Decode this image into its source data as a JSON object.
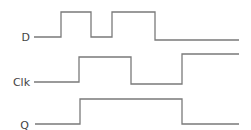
{
  "diagram": {
    "type": "timing-diagram",
    "stroke_color": "#7a7a7a",
    "label_color": "#444444",
    "signals": [
      {
        "name": "D",
        "label_x": 30,
        "label_y": 41,
        "points": "34,37 61,37 61,12 91,12 91,37 112,37 112,12 155,12 155,40 239,40"
      },
      {
        "name": "Clk",
        "label_x": 30,
        "label_y": 86,
        "points": "34,82 79,82 79,57 131,57 131,84 182,84 182,54 239,54"
      },
      {
        "name": "Q",
        "label_x": 29,
        "label_y": 129,
        "points": "35,124 80,124 80,99 182,99 182,124 239,124"
      }
    ]
  }
}
